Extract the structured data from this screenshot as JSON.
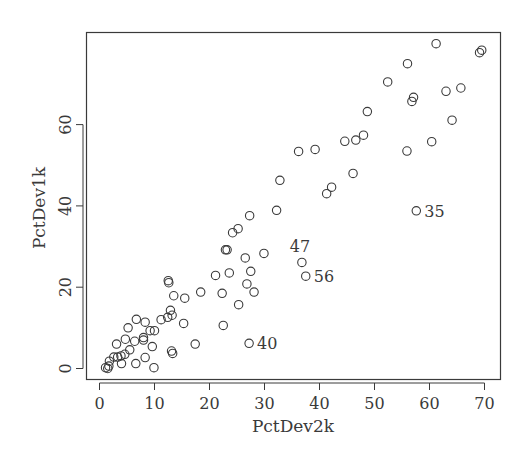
{
  "chart_data": {
    "type": "scatter",
    "title": "",
    "xlabel": "PctDev2k",
    "ylabel": "PctDev1k",
    "xlim": [
      0,
      72
    ],
    "ylim": [
      -2.5,
      82
    ],
    "xticks": [
      0,
      10,
      20,
      30,
      40,
      50,
      60,
      70
    ],
    "yticks": [
      0,
      20,
      40,
      60
    ],
    "grid": false,
    "legend": null,
    "marker": "open-circle",
    "points": [
      {
        "x": 1.1,
        "y": 0.2
      },
      {
        "x": 1.5,
        "y": 0.0
      },
      {
        "x": 1.7,
        "y": 0.6
      },
      {
        "x": 1.8,
        "y": 1.8
      },
      {
        "x": 2.6,
        "y": 2.8
      },
      {
        "x": 3.3,
        "y": 2.8
      },
      {
        "x": 3.1,
        "y": 6.0
      },
      {
        "x": 4.0,
        "y": 1.2
      },
      {
        "x": 3.9,
        "y": 3.1
      },
      {
        "x": 4.6,
        "y": 3.5
      },
      {
        "x": 4.7,
        "y": 7.2
      },
      {
        "x": 5.2,
        "y": 10.0
      },
      {
        "x": 5.5,
        "y": 4.6
      },
      {
        "x": 6.4,
        "y": 6.7
      },
      {
        "x": 6.6,
        "y": 1.2
      },
      {
        "x": 6.7,
        "y": 12.1
      },
      {
        "x": 8.0,
        "y": 7.6
      },
      {
        "x": 8.0,
        "y": 7.0
      },
      {
        "x": 8.3,
        "y": 11.4
      },
      {
        "x": 8.3,
        "y": 2.7
      },
      {
        "x": 9.2,
        "y": 9.3
      },
      {
        "x": 9.6,
        "y": 5.4
      },
      {
        "x": 10.0,
        "y": 9.3
      },
      {
        "x": 9.9,
        "y": 0.2
      },
      {
        "x": 11.2,
        "y": 12.0
      },
      {
        "x": 12.4,
        "y": 12.6
      },
      {
        "x": 12.6,
        "y": 21.1
      },
      {
        "x": 12.5,
        "y": 21.6
      },
      {
        "x": 12.9,
        "y": 14.3
      },
      {
        "x": 13.2,
        "y": 13.1
      },
      {
        "x": 13.1,
        "y": 4.3
      },
      {
        "x": 13.3,
        "y": 3.7
      },
      {
        "x": 13.5,
        "y": 17.9
      },
      {
        "x": 15.3,
        "y": 11.1
      },
      {
        "x": 15.5,
        "y": 17.3
      },
      {
        "x": 17.4,
        "y": 6.0
      },
      {
        "x": 18.4,
        "y": 18.8
      },
      {
        "x": 21.1,
        "y": 22.9
      },
      {
        "x": 22.3,
        "y": 18.5
      },
      {
        "x": 22.5,
        "y": 10.6
      },
      {
        "x": 22.9,
        "y": 29.2
      },
      {
        "x": 23.2,
        "y": 29.2
      },
      {
        "x": 23.6,
        "y": 23.5
      },
      {
        "x": 24.2,
        "y": 33.4
      },
      {
        "x": 25.2,
        "y": 34.4
      },
      {
        "x": 25.3,
        "y": 15.7
      },
      {
        "x": 26.5,
        "y": 27.2
      },
      {
        "x": 26.8,
        "y": 20.8
      },
      {
        "x": 27.2,
        "y": 6.2,
        "label": "40"
      },
      {
        "x": 27.3,
        "y": 37.6
      },
      {
        "x": 27.5,
        "y": 23.9
      },
      {
        "x": 28.1,
        "y": 18.8
      },
      {
        "x": 29.9,
        "y": 28.3
      },
      {
        "x": 32.2,
        "y": 38.9
      },
      {
        "x": 32.8,
        "y": 46.3
      },
      {
        "x": 36.2,
        "y": 53.4
      },
      {
        "x": 36.8,
        "y": 26.1,
        "label": "47"
      },
      {
        "x": 37.5,
        "y": 22.7,
        "label": "56"
      },
      {
        "x": 39.2,
        "y": 53.9
      },
      {
        "x": 41.3,
        "y": 43.0
      },
      {
        "x": 42.2,
        "y": 44.6
      },
      {
        "x": 44.6,
        "y": 55.9
      },
      {
        "x": 46.1,
        "y": 48.0
      },
      {
        "x": 46.6,
        "y": 56.2
      },
      {
        "x": 48.0,
        "y": 57.4
      },
      {
        "x": 48.7,
        "y": 63.2
      },
      {
        "x": 52.4,
        "y": 70.5
      },
      {
        "x": 55.9,
        "y": 53.5
      },
      {
        "x": 56.0,
        "y": 75.0
      },
      {
        "x": 56.8,
        "y": 65.7
      },
      {
        "x": 57.1,
        "y": 66.7
      },
      {
        "x": 57.6,
        "y": 38.8,
        "label": "35"
      },
      {
        "x": 60.4,
        "y": 55.8
      },
      {
        "x": 61.2,
        "y": 79.9
      },
      {
        "x": 63.0,
        "y": 68.2
      },
      {
        "x": 64.1,
        "y": 61.1
      },
      {
        "x": 65.7,
        "y": 69.0
      },
      {
        "x": 69.1,
        "y": 77.7
      },
      {
        "x": 69.5,
        "y": 78.3
      }
    ],
    "annotations": [
      {
        "text": "35",
        "x": 57.6,
        "y": 38.8,
        "position": "right"
      },
      {
        "text": "47",
        "x": 36.8,
        "y": 26.1,
        "position": "above-left"
      },
      {
        "text": "56",
        "x": 37.5,
        "y": 22.7,
        "position": "right"
      },
      {
        "text": "40",
        "x": 27.2,
        "y": 6.2,
        "position": "right"
      }
    ]
  },
  "colors": {
    "ink": "#3a3a3a",
    "background": "#ffffff"
  }
}
